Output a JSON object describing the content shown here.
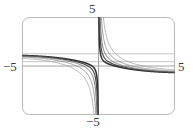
{
  "figure": {
    "kind": "math-plot",
    "frame": {
      "stroke": "#b9b9b9",
      "corner_radius": 7,
      "x": 22,
      "y": 17,
      "width": 153,
      "height": 98
    },
    "background": "#ffffff"
  },
  "labels": {
    "top": "5",
    "bottom": "−5",
    "left": "−5",
    "right": "5",
    "color": "#3a3a3a"
  },
  "chart_data": {
    "type": "line",
    "title": "",
    "xlabel": "",
    "ylabel": "",
    "xlim": [
      -6.2,
      6.2
    ],
    "ylim": [
      -6.2,
      6.2
    ],
    "xticks": [
      -5,
      5
    ],
    "xticklabels": [
      "−5",
      "5"
    ],
    "yticks": [
      -5,
      5
    ],
    "yticklabels": [
      "−5",
      "5"
    ],
    "grid": false,
    "axes": {
      "x_axis_y": 0,
      "y_axis_x": 0,
      "stroke": "#9a9a9a"
    },
    "legend": null,
    "asymptotes": {
      "vertical": [
        0
      ],
      "horizontal": [
        1.55,
        0.55
      ]
    },
    "series": [
      {
        "name": "curve-1",
        "color": "#2b2b2b",
        "width": 1.5,
        "left_value": 1.45,
        "right_value": -0.95,
        "steepness": 0.22
      },
      {
        "name": "curve-2",
        "color": "#4a4a4a",
        "width": 1.2,
        "left_value": 1.45,
        "right_value": -0.95,
        "steepness": 0.45
      },
      {
        "name": "curve-3",
        "color": "#6e6e6e",
        "width": 1.0,
        "left_value": 1.45,
        "right_value": -0.95,
        "steepness": 0.8
      },
      {
        "name": "curve-4",
        "color": "#8c8c8c",
        "width": 0.9,
        "left_value": 1.45,
        "right_value": -0.95,
        "steepness": 1.4
      },
      {
        "name": "curve-5",
        "color": "#a0a0a0",
        "width": 0.8,
        "left_value": 1.45,
        "right_value": -0.95,
        "steepness": 2.4
      }
    ]
  }
}
